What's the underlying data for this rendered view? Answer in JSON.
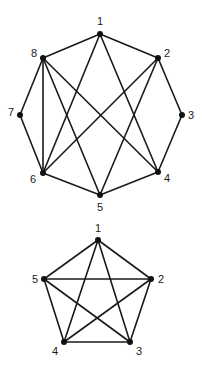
{
  "graphs": [
    {
      "name": "octagon-graph",
      "nodes": [
        {
          "id": "1",
          "x": 100,
          "y": 34,
          "lx": 100,
          "ly": 25,
          "anchor": "middle"
        },
        {
          "id": "2",
          "x": 158,
          "y": 58,
          "lx": 164,
          "ly": 57,
          "anchor": "start"
        },
        {
          "id": "3",
          "x": 182,
          "y": 115,
          "lx": 188,
          "ly": 119,
          "anchor": "start"
        },
        {
          "id": "4",
          "x": 158,
          "y": 172,
          "lx": 164,
          "ly": 182,
          "anchor": "start"
        },
        {
          "id": "5",
          "x": 100,
          "y": 195,
          "lx": 100,
          "ly": 211,
          "anchor": "middle"
        },
        {
          "id": "6",
          "x": 43,
          "y": 173,
          "lx": 36,
          "ly": 183,
          "anchor": "end"
        },
        {
          "id": "7",
          "x": 20,
          "y": 115,
          "lx": 14,
          "ly": 116,
          "anchor": "end"
        },
        {
          "id": "8",
          "x": 43,
          "y": 58,
          "lx": 37,
          "ly": 57,
          "anchor": "end"
        }
      ],
      "edges": [
        [
          "1",
          "8"
        ],
        [
          "1",
          "2"
        ],
        [
          "1",
          "6"
        ],
        [
          "1",
          "4"
        ],
        [
          "8",
          "7"
        ],
        [
          "8",
          "6"
        ],
        [
          "8",
          "5"
        ],
        [
          "8",
          "4"
        ],
        [
          "2",
          "3"
        ],
        [
          "2",
          "6"
        ],
        [
          "2",
          "5"
        ],
        [
          "7",
          "6"
        ],
        [
          "3",
          "4"
        ],
        [
          "6",
          "5"
        ],
        [
          "5",
          "4"
        ]
      ]
    },
    {
      "name": "pentagon-graph",
      "nodes": [
        {
          "id": "1",
          "x": 98,
          "y": 240,
          "lx": 98,
          "ly": 232,
          "anchor": "middle"
        },
        {
          "id": "2",
          "x": 151,
          "y": 279,
          "lx": 158,
          "ly": 283,
          "anchor": "start"
        },
        {
          "id": "3",
          "x": 130,
          "y": 342,
          "lx": 136,
          "ly": 355,
          "anchor": "start"
        },
        {
          "id": "4",
          "x": 64,
          "y": 342,
          "lx": 58,
          "ly": 355,
          "anchor": "end"
        },
        {
          "id": "5",
          "x": 44,
          "y": 279,
          "lx": 38,
          "ly": 283,
          "anchor": "end"
        }
      ],
      "edges": [
        [
          "1",
          "2"
        ],
        [
          "1",
          "3"
        ],
        [
          "1",
          "4"
        ],
        [
          "1",
          "5"
        ],
        [
          "2",
          "3"
        ],
        [
          "2",
          "4"
        ],
        [
          "2",
          "5"
        ],
        [
          "3",
          "4"
        ],
        [
          "3",
          "5"
        ],
        [
          "4",
          "5"
        ]
      ]
    }
  ]
}
